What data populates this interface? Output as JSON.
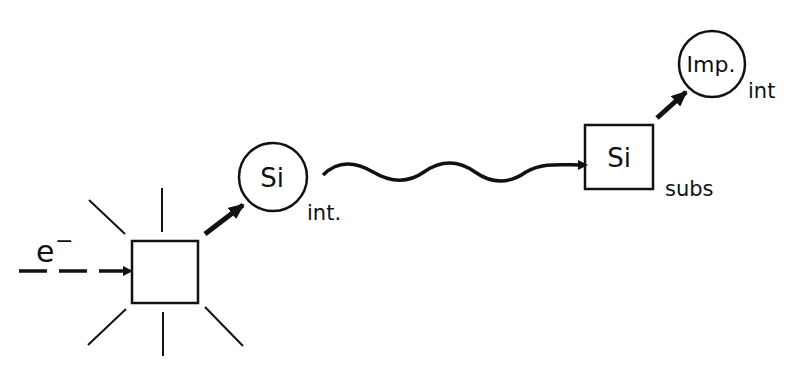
{
  "diagram": {
    "type": "process-schematic",
    "nodes": [
      {
        "id": "impact-site",
        "shape": "square",
        "label": "",
        "note": "radiating lines indicate collision"
      },
      {
        "id": "si-int",
        "shape": "circle",
        "label": "Si",
        "subscript": "int."
      },
      {
        "id": "si-subs",
        "shape": "square",
        "label": "Si",
        "subscript": "subs"
      },
      {
        "id": "imp-int",
        "shape": "circle",
        "label": "Imp.",
        "subscript": "int"
      }
    ],
    "edges": [
      {
        "from": "electron",
        "to": "impact-site",
        "style": "dashed-arrow"
      },
      {
        "from": "impact-site",
        "to": "si-int",
        "style": "bold-arrow"
      },
      {
        "from": "si-int",
        "to": "si-subs",
        "style": "wavy-arrow"
      },
      {
        "from": "si-subs",
        "to": "imp-int",
        "style": "bold-arrow"
      }
    ],
    "incoming": {
      "label": "e",
      "superscript": "−"
    },
    "colors": {
      "stroke": "#111111",
      "background": "#ffffff"
    }
  }
}
